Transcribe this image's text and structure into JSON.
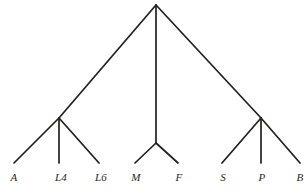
{
  "figure": {
    "name": "cladogram",
    "background_color": "#ffffff",
    "line_color": "#22201f",
    "label_color": "#2a2724",
    "width": 308,
    "height": 192
  },
  "chart_data": {
    "type": "diagram",
    "subtype": "cladogram-phylogenetic-tree",
    "title": "",
    "xlabel": "",
    "ylabel": "",
    "grid": false,
    "legend": null,
    "root": {
      "name": "root",
      "x": 156,
      "y": 5,
      "children": [
        "clade-left",
        "clade-middle",
        "clade-right"
      ]
    },
    "internal_nodes": [
      {
        "name": "clade-left",
        "x": 59,
        "y": 118,
        "children": [
          "A",
          "L4",
          "L6"
        ]
      },
      {
        "name": "clade-middle",
        "x": 156,
        "y": 143,
        "children": [
          "M",
          "F"
        ]
      },
      {
        "name": "clade-right",
        "x": 261,
        "y": 118,
        "children": [
          "S",
          "P",
          "B"
        ]
      }
    ],
    "leaves": [
      {
        "label": "A",
        "tip_x": 14,
        "tip_y": 163,
        "label_x": 14,
        "label_y": 172,
        "parent": "clade-left"
      },
      {
        "label": "L4",
        "tip_x": 59,
        "tip_y": 163,
        "label_x": 61,
        "label_y": 172,
        "parent": "clade-left"
      },
      {
        "label": "L6",
        "tip_x": 99,
        "tip_y": 163,
        "label_x": 101,
        "label_y": 172,
        "parent": "clade-left"
      },
      {
        "label": "M",
        "tip_x": 135,
        "tip_y": 163,
        "label_x": 136,
        "label_y": 172,
        "parent": "clade-middle"
      },
      {
        "label": "F",
        "tip_x": 178,
        "tip_y": 163,
        "label_x": 179,
        "label_y": 172,
        "parent": "clade-middle"
      },
      {
        "label": "S",
        "tip_x": 222,
        "tip_y": 163,
        "label_x": 223,
        "label_y": 172,
        "parent": "clade-right"
      },
      {
        "label": "P",
        "tip_x": 261,
        "tip_y": 163,
        "label_x": 262,
        "label_y": 172,
        "parent": "clade-right"
      },
      {
        "label": "B",
        "tip_x": 300,
        "tip_y": 163,
        "label_x": 300,
        "label_y": 172,
        "parent": "clade-right"
      }
    ],
    "edges": [
      {
        "name": "root-to-clade-left",
        "x1": 156,
        "y1": 5,
        "x2": 59,
        "y2": 118
      },
      {
        "name": "root-to-clade-middle",
        "x1": 156,
        "y1": 5,
        "x2": 156,
        "y2": 143
      },
      {
        "name": "root-to-clade-right",
        "x1": 156,
        "y1": 5,
        "x2": 261,
        "y2": 118
      },
      {
        "name": "clade-left-to-A",
        "x1": 59,
        "y1": 118,
        "x2": 14,
        "y2": 163
      },
      {
        "name": "clade-left-to-L4",
        "x1": 59,
        "y1": 118,
        "x2": 59,
        "y2": 163
      },
      {
        "name": "clade-left-to-L6",
        "x1": 59,
        "y1": 118,
        "x2": 99,
        "y2": 163
      },
      {
        "name": "clade-middle-to-M",
        "x1": 156,
        "y1": 143,
        "x2": 135,
        "y2": 163
      },
      {
        "name": "clade-middle-to-F",
        "x1": 156,
        "y1": 143,
        "x2": 178,
        "y2": 163
      },
      {
        "name": "clade-right-to-S",
        "x1": 261,
        "y1": 118,
        "x2": 222,
        "y2": 163
      },
      {
        "name": "clade-right-to-P",
        "x1": 261,
        "y1": 118,
        "x2": 261,
        "y2": 163
      },
      {
        "name": "clade-right-to-B",
        "x1": 261,
        "y1": 118,
        "x2": 300,
        "y2": 163
      }
    ]
  }
}
